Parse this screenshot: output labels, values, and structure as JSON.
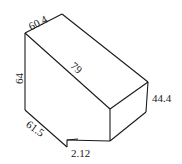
{
  "diagram": {
    "type": "3d-solid-dimension-drawing",
    "stroke_color": "#1a1a1a",
    "background": "#ffffff",
    "labels": {
      "top_edge": "60.4",
      "slant_face": "79",
      "left_height": "64",
      "right_height": "44.4",
      "bottom_left": "61.5",
      "notch": "2.12"
    }
  }
}
